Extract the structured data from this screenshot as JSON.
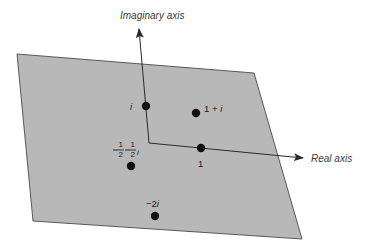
{
  "diagram": {
    "colors": {
      "plane_fill": "#b8b8b8",
      "plane_edge": "#4a4a4a",
      "axis": "#2a2a2a",
      "point": "#111111",
      "background": "#ffffff"
    },
    "plane": {
      "corners": [
        [
          17,
          54
        ],
        [
          254,
          73
        ],
        [
          302,
          239
        ],
        [
          33,
          221
        ]
      ]
    },
    "axes": {
      "imaginary": {
        "label": "Imaginary axis",
        "from": [
          149,
          143
        ],
        "to": [
          139,
          28
        ]
      },
      "real": {
        "label": "Real axis",
        "from": [
          149,
          143
        ],
        "to": [
          304,
          158
        ]
      }
    },
    "points": [
      {
        "id": "i",
        "label": "i",
        "x": 146,
        "y": 106
      },
      {
        "id": "one-plus-i",
        "label_main": "1 + ",
        "label_italic": "i",
        "x": 196,
        "y": 113
      },
      {
        "id": "one",
        "label": "1",
        "x": 201,
        "y": 148
      },
      {
        "id": "neg-half-neg-half-i",
        "label_num": "1",
        "label_den": "2",
        "label_italic": "i",
        "x": 131,
        "y": 166
      },
      {
        "id": "neg-2i",
        "label_main": "−2",
        "label_italic": "i",
        "x": 155,
        "y": 216
      }
    ]
  }
}
